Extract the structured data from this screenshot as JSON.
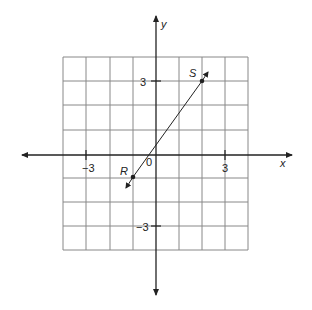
{
  "diagram": {
    "type": "coordinate-plane",
    "grid": {
      "xmin": -4,
      "xmax": 4,
      "ymin": -4,
      "ymax": 4,
      "step": 1
    },
    "axes": {
      "x_label": "x",
      "y_label": "y",
      "origin_label": "0"
    },
    "ticks": {
      "x_neg": "−3",
      "x_pos": "3",
      "y_pos": "3",
      "y_neg": "−3"
    },
    "points": [
      {
        "name": "S",
        "x": 2,
        "y": 3
      },
      {
        "name": "R",
        "x": -1,
        "y": -1
      }
    ],
    "line": {
      "through": [
        "R",
        "S"
      ],
      "arrows": "both"
    },
    "colors": {
      "grid": "#777777",
      "axis": "#222222",
      "line": "#222222"
    }
  }
}
